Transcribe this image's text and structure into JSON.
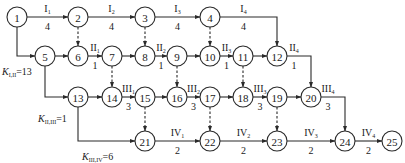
{
  "diagram": {
    "type": "activity-on-arrow network (flow line scheduling)",
    "node_radius": 10,
    "nodes": [
      {
        "id": "1",
        "x": 17,
        "y": 17
      },
      {
        "id": "2",
        "x": 78,
        "y": 17
      },
      {
        "id": "3",
        "x": 145,
        "y": 17
      },
      {
        "id": "4",
        "x": 210,
        "y": 17
      },
      {
        "id": "5",
        "x": 45,
        "y": 56
      },
      {
        "id": "6",
        "x": 78,
        "y": 56
      },
      {
        "id": "7",
        "x": 112,
        "y": 56
      },
      {
        "id": "8",
        "x": 145,
        "y": 56
      },
      {
        "id": "9",
        "x": 177,
        "y": 56
      },
      {
        "id": "10",
        "x": 210,
        "y": 56
      },
      {
        "id": "11",
        "x": 243,
        "y": 56
      },
      {
        "id": "12",
        "x": 277,
        "y": 56
      },
      {
        "id": "13",
        "x": 78,
        "y": 97
      },
      {
        "id": "14",
        "x": 112,
        "y": 97
      },
      {
        "id": "15",
        "x": 145,
        "y": 97
      },
      {
        "id": "16",
        "x": 177,
        "y": 97
      },
      {
        "id": "17",
        "x": 210,
        "y": 97
      },
      {
        "id": "18",
        "x": 243,
        "y": 97
      },
      {
        "id": "19",
        "x": 277,
        "y": 97
      },
      {
        "id": "20",
        "x": 311,
        "y": 97
      },
      {
        "id": "21",
        "x": 145,
        "y": 141
      },
      {
        "id": "22",
        "x": 210,
        "y": 141
      },
      {
        "id": "23",
        "x": 277,
        "y": 141
      },
      {
        "id": "24",
        "x": 345,
        "y": 141
      },
      {
        "id": "25",
        "x": 392,
        "y": 141
      }
    ],
    "edges": [
      {
        "from": "1",
        "to": "2",
        "style": "solid",
        "label_main": "I",
        "label_sub": "1",
        "duration": "4"
      },
      {
        "from": "2",
        "to": "3",
        "style": "solid",
        "label_main": "I",
        "label_sub": "2",
        "duration": "4"
      },
      {
        "from": "3",
        "to": "4",
        "style": "solid",
        "label_main": "I",
        "label_sub": "3",
        "duration": "4"
      },
      {
        "from": "4",
        "to": "12",
        "style": "solid",
        "route": "right-down",
        "label_main": "I",
        "label_sub": "4",
        "duration": "4"
      },
      {
        "from": "1",
        "to": "5",
        "style": "solid",
        "route": "down-right"
      },
      {
        "from": "5",
        "to": "6",
        "style": "solid"
      },
      {
        "from": "6",
        "to": "7",
        "style": "solid",
        "label_main": "II",
        "label_sub": "1",
        "duration": "1"
      },
      {
        "from": "7",
        "to": "8",
        "style": "solid"
      },
      {
        "from": "8",
        "to": "9",
        "style": "solid",
        "label_main": "II",
        "label_sub": "2",
        "duration": "1"
      },
      {
        "from": "9",
        "to": "10",
        "style": "solid"
      },
      {
        "from": "10",
        "to": "11",
        "style": "solid",
        "label_main": "II",
        "label_sub": "3",
        "duration": "1"
      },
      {
        "from": "11",
        "to": "12",
        "style": "solid"
      },
      {
        "from": "12",
        "to": "20",
        "style": "solid",
        "route": "right-down",
        "label_main": "II",
        "label_sub": "4",
        "duration": "1"
      },
      {
        "from": "2",
        "to": "6",
        "style": "dashed"
      },
      {
        "from": "3",
        "to": "8",
        "style": "dashed"
      },
      {
        "from": "4",
        "to": "10",
        "style": "dashed"
      },
      {
        "from": "5",
        "to": "13",
        "style": "solid",
        "route": "down-right"
      },
      {
        "from": "13",
        "to": "14",
        "style": "solid"
      },
      {
        "from": "14",
        "to": "15",
        "style": "solid",
        "label_main": "III",
        "label_sub": "1",
        "duration": "3"
      },
      {
        "from": "15",
        "to": "16",
        "style": "solid"
      },
      {
        "from": "16",
        "to": "17",
        "style": "solid",
        "label_main": "III",
        "label_sub": "2",
        "duration": "3"
      },
      {
        "from": "17",
        "to": "18",
        "style": "solid"
      },
      {
        "from": "18",
        "to": "19",
        "style": "solid",
        "label_main": "III",
        "label_sub": "3",
        "duration": "3"
      },
      {
        "from": "19",
        "to": "20",
        "style": "solid"
      },
      {
        "from": "20",
        "to": "24",
        "style": "solid",
        "route": "right-down",
        "label_main": "III",
        "label_sub": "4",
        "duration": "3"
      },
      {
        "from": "7",
        "to": "14",
        "style": "dashed"
      },
      {
        "from": "9",
        "to": "16",
        "style": "dashed"
      },
      {
        "from": "11",
        "to": "18",
        "style": "dashed"
      },
      {
        "from": "13",
        "to": "21",
        "style": "solid",
        "route": "down-right"
      },
      {
        "from": "21",
        "to": "22",
        "style": "solid",
        "label_main": "IV",
        "label_sub": "1",
        "duration": "2"
      },
      {
        "from": "22",
        "to": "23",
        "style": "solid",
        "label_main": "IV",
        "label_sub": "2",
        "duration": "2"
      },
      {
        "from": "23",
        "to": "24",
        "style": "solid",
        "label_main": "IV",
        "label_sub": "3",
        "duration": "2"
      },
      {
        "from": "24",
        "to": "25",
        "style": "solid",
        "label_main": "IV",
        "label_sub": "4",
        "duration": "2"
      },
      {
        "from": "15",
        "to": "21",
        "style": "dashed"
      },
      {
        "from": "17",
        "to": "22",
        "style": "dashed"
      },
      {
        "from": "19",
        "to": "23",
        "style": "dashed"
      }
    ],
    "annotations": [
      {
        "name": "k-i-ii",
        "symbol": "K",
        "sub": "I,II",
        "value": "=13",
        "x": 2,
        "y": 75
      },
      {
        "name": "k-ii-iii",
        "symbol": "K",
        "sub": "II,III",
        "value": "=1",
        "x": 38,
        "y": 122
      },
      {
        "name": "k-iii-iv",
        "symbol": "K",
        "sub": "III,IV",
        "value": "=6",
        "x": 82,
        "y": 160
      }
    ]
  }
}
